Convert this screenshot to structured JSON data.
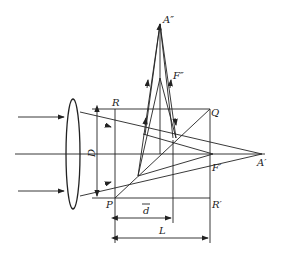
{
  "diagram": {
    "labels": {
      "A_double_prime": "A″",
      "F_double_prime": "F″",
      "R": "R",
      "Q": "Q",
      "D": "D",
      "A_prime": "A′",
      "F_prime": "F′",
      "P": "P",
      "R_prime": "R′",
      "d_bar": "d",
      "L": "L"
    },
    "caption": "",
    "colors": {
      "line": "#222222",
      "background": "#ffffff"
    }
  }
}
